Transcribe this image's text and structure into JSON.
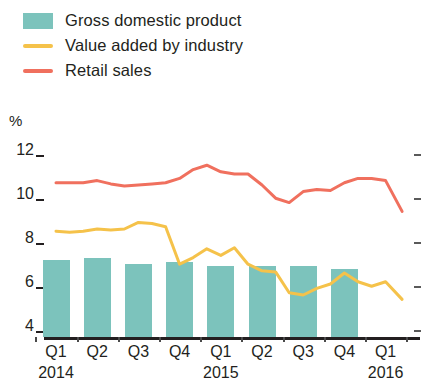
{
  "legend": {
    "items": [
      {
        "label": "Gross domestic product",
        "mark": "swatch",
        "icon": "teal-square-swatch",
        "color": "#7cc3bc"
      },
      {
        "label": "Value added by industry",
        "mark": "line",
        "icon": "yellow-line-swatch",
        "color": "#f5c24a"
      },
      {
        "label": "Retail sales",
        "mark": "line",
        "icon": "red-line-swatch",
        "color": "#f0705e"
      }
    ]
  },
  "axis": {
    "unit": "%",
    "yticks": [
      "12",
      "10",
      "8",
      "6",
      "4"
    ],
    "xlabels": [
      "Q1",
      "Q2",
      "Q3",
      "Q4",
      "Q1",
      "Q2",
      "Q3",
      "Q4",
      "Q1"
    ],
    "years": [
      {
        "label": "2014",
        "at": 0
      },
      {
        "label": "2015",
        "at": 4
      },
      {
        "label": "2016",
        "at": 8
      }
    ]
  },
  "chart_data": {
    "type": "bar",
    "title": "",
    "xlabel": "",
    "ylabel": "%",
    "ylim": [
      4,
      12
    ],
    "yticks": [
      4,
      6,
      8,
      10,
      12
    ],
    "grid": false,
    "legend_position": "top-left",
    "categories": [
      "Q1 2014",
      "Q2 2014",
      "Q3 2014",
      "Q4 2014",
      "Q1 2015",
      "Q2 2015",
      "Q3 2015",
      "Q4 2015",
      "Q1 2016"
    ],
    "series": [
      {
        "name": "Gross domestic product",
        "type": "bar",
        "color": "#7cc3bc",
        "values": [
          7.1,
          7.2,
          6.9,
          7.0,
          6.8,
          6.8,
          6.8,
          6.7,
          null
        ]
      },
      {
        "name": "Value added by industry",
        "type": "line",
        "color": "#f5c24a",
        "monthly_x": [
          0.0,
          0.33,
          0.66,
          1.0,
          1.33,
          1.66,
          2.0,
          2.33,
          2.66,
          3.0,
          3.33,
          3.66,
          4.0,
          4.33,
          4.66,
          5.0,
          5.33,
          5.66,
          6.0,
          6.33,
          6.66,
          7.0,
          7.33,
          7.66,
          8.0,
          8.4
        ],
        "monthly_values": [
          8.4,
          8.35,
          8.4,
          8.5,
          8.45,
          8.5,
          8.8,
          8.75,
          8.6,
          6.9,
          7.2,
          7.6,
          7.3,
          7.65,
          6.9,
          6.6,
          6.55,
          5.6,
          5.5,
          5.8,
          6.0,
          6.5,
          6.1,
          5.9,
          6.1,
          5.3
        ]
      },
      {
        "name": "Retail sales",
        "type": "line",
        "color": "#f0705e",
        "monthly_x": [
          0.0,
          0.33,
          0.66,
          1.0,
          1.33,
          1.66,
          2.0,
          2.33,
          2.66,
          3.0,
          3.33,
          3.66,
          4.0,
          4.33,
          4.66,
          5.0,
          5.33,
          5.66,
          6.0,
          6.33,
          6.66,
          7.0,
          7.33,
          7.66,
          8.0,
          8.4
        ],
        "monthly_values": [
          10.6,
          10.6,
          10.6,
          10.7,
          10.55,
          10.45,
          10.5,
          10.55,
          10.6,
          10.8,
          11.2,
          11.4,
          11.1,
          11.0,
          11.0,
          10.5,
          9.9,
          9.7,
          10.2,
          10.3,
          10.25,
          10.6,
          10.8,
          10.8,
          10.7,
          9.3
        ]
      }
    ]
  }
}
